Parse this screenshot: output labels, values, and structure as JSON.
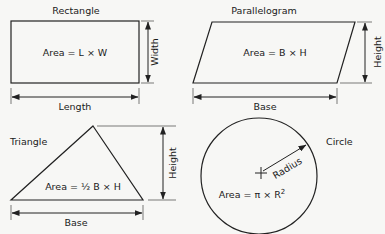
{
  "diagram": {
    "shapes": [
      {
        "name": "Rectangle",
        "formula": "Area = L × W",
        "dimensions": {
          "horizontal": "Length",
          "vertical": "Width"
        }
      },
      {
        "name": "Parallelogram",
        "formula": "Area = B × H",
        "dimensions": {
          "horizontal": "Base",
          "vertical": "Height"
        }
      },
      {
        "name": "Triangle",
        "formula": "Area = ½ B × H",
        "dimensions": {
          "horizontal": "Base",
          "vertical": "Height"
        }
      },
      {
        "name": "Circle",
        "formula_prefix": "Area = π × R",
        "formula_exponent": "2",
        "dimensions": {
          "radial": "Radius"
        }
      }
    ],
    "colors": {
      "stroke": "#222222",
      "background": "#f7f7f5"
    }
  }
}
